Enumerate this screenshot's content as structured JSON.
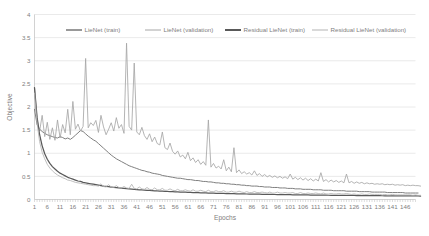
{
  "chart_data": {
    "type": "line",
    "title": "",
    "xlabel": "Epochs",
    "ylabel": "Objective",
    "xlim": [
      1,
      150
    ],
    "ylim": [
      0,
      4
    ],
    "grid": true,
    "legend_position": "top",
    "ytick_labels": [
      "0",
      "0.5",
      "1",
      "1.5",
      "2",
      "2.5",
      "3",
      "3.5",
      "4"
    ],
    "ytick_values": [
      0,
      0.5,
      1,
      1.5,
      2,
      2.5,
      3,
      3.5,
      4
    ],
    "xtick_labels": [
      "1",
      "6",
      "11",
      "16",
      "21",
      "26",
      "31",
      "36",
      "41",
      "46",
      "51",
      "56",
      "61",
      "66",
      "71",
      "76",
      "81",
      "86",
      "91",
      "96",
      "101",
      "106",
      "111",
      "116",
      "121",
      "126",
      "131",
      "136",
      "141",
      "146"
    ],
    "xtick_values": [
      1,
      6,
      11,
      16,
      21,
      26,
      31,
      36,
      41,
      46,
      51,
      56,
      61,
      66,
      71,
      76,
      81,
      86,
      91,
      96,
      101,
      106,
      111,
      116,
      121,
      126,
      131,
      136,
      141,
      146
    ],
    "colors": {
      "lienet_train": "#7f7f7f",
      "lienet_validation": "#a6a6a6",
      "residual_lienet_train": "#595959",
      "residual_lienet_validation": "#b3b3b3"
    },
    "series": [
      {
        "name": "LieNet (train)",
        "color": "#7f7f7f",
        "width": 1.0,
        "values": [
          1.95,
          1.62,
          1.52,
          1.47,
          1.43,
          1.4,
          1.38,
          1.36,
          1.34,
          1.33,
          1.36,
          1.34,
          1.31,
          1.33,
          1.3,
          1.34,
          1.39,
          1.44,
          1.49,
          1.47,
          1.42,
          1.37,
          1.33,
          1.29,
          1.26,
          1.21,
          1.16,
          1.11,
          1.06,
          1.01,
          0.96,
          0.92,
          0.88,
          0.85,
          0.82,
          0.79,
          0.76,
          0.73,
          0.71,
          0.69,
          0.67,
          0.65,
          0.63,
          0.62,
          0.6,
          0.59,
          0.57,
          0.56,
          0.55,
          0.54,
          0.52,
          0.51,
          0.5,
          0.49,
          0.48,
          0.47,
          0.46,
          0.46,
          0.45,
          0.44,
          0.43,
          0.43,
          0.42,
          0.41,
          0.41,
          0.4,
          0.39,
          0.39,
          0.38,
          0.38,
          0.37,
          0.36,
          0.36,
          0.35,
          0.35,
          0.34,
          0.34,
          0.33,
          0.33,
          0.32,
          0.32,
          0.31,
          0.31,
          0.3,
          0.3,
          0.29,
          0.29,
          0.29,
          0.28,
          0.28,
          0.27,
          0.27,
          0.27,
          0.26,
          0.26,
          0.26,
          0.25,
          0.25,
          0.25,
          0.24,
          0.24,
          0.24,
          0.23,
          0.23,
          0.23,
          0.22,
          0.22,
          0.22,
          0.22,
          0.21,
          0.21,
          0.21,
          0.21,
          0.2,
          0.2,
          0.2,
          0.2,
          0.19,
          0.19,
          0.19,
          0.19,
          0.19,
          0.18,
          0.18,
          0.18,
          0.18,
          0.18,
          0.17,
          0.17,
          0.17,
          0.17,
          0.17,
          0.16,
          0.16,
          0.16,
          0.16,
          0.16,
          0.16,
          0.15,
          0.15,
          0.15,
          0.15,
          0.15,
          0.15,
          0.15,
          0.14,
          0.14,
          0.14,
          0.14,
          0.14,
          0.14
        ]
      },
      {
        "name": "LieNet (validation)",
        "color": "#a6a6a6",
        "width": 0.85,
        "values": [
          2.42,
          1.73,
          1.48,
          1.82,
          1.36,
          1.67,
          1.3,
          1.55,
          1.28,
          1.72,
          1.33,
          1.62,
          1.44,
          1.95,
          1.4,
          2.12,
          1.52,
          1.63,
          1.48,
          1.58,
          3.05,
          1.55,
          1.66,
          1.6,
          1.71,
          1.45,
          1.82,
          1.57,
          1.4,
          1.52,
          1.66,
          1.48,
          1.77,
          1.54,
          1.62,
          1.43,
          3.38,
          1.58,
          1.5,
          2.95,
          1.46,
          1.4,
          1.56,
          1.38,
          1.3,
          1.42,
          1.25,
          1.35,
          1.21,
          1.18,
          1.46,
          1.12,
          1.08,
          1.22,
          1.04,
          0.98,
          1.05,
          0.92,
          0.96,
          0.88,
          1.02,
          0.84,
          0.9,
          0.8,
          0.86,
          0.76,
          0.82,
          0.74,
          1.72,
          0.7,
          0.78,
          0.68,
          0.72,
          0.66,
          0.86,
          0.62,
          0.7,
          0.6,
          1.12,
          0.58,
          0.64,
          0.56,
          0.6,
          0.55,
          0.58,
          0.53,
          0.62,
          0.52,
          0.56,
          0.5,
          0.54,
          0.49,
          0.52,
          0.48,
          0.51,
          0.47,
          0.5,
          0.46,
          0.49,
          0.45,
          0.55,
          0.44,
          0.48,
          0.43,
          0.47,
          0.42,
          0.46,
          0.41,
          0.45,
          0.4,
          0.44,
          0.4,
          0.58,
          0.39,
          0.43,
          0.38,
          0.42,
          0.38,
          0.41,
          0.37,
          0.4,
          0.36,
          0.55,
          0.36,
          0.39,
          0.35,
          0.38,
          0.35,
          0.37,
          0.34,
          0.36,
          0.34,
          0.35,
          0.33,
          0.34,
          0.33,
          0.34,
          0.32,
          0.33,
          0.32,
          0.33,
          0.31,
          0.32,
          0.31,
          0.32,
          0.3,
          0.31,
          0.3,
          0.31,
          0.3,
          0.3,
          0.29
        ]
      },
      {
        "name": "Residual LieNet (train)",
        "color": "#595959",
        "width": 1.25,
        "values": [
          2.42,
          1.78,
          1.4,
          1.16,
          0.99,
          0.87,
          0.78,
          0.71,
          0.66,
          0.61,
          0.57,
          0.54,
          0.51,
          0.48,
          0.46,
          0.44,
          0.42,
          0.4,
          0.39,
          0.37,
          0.36,
          0.35,
          0.34,
          0.33,
          0.32,
          0.31,
          0.3,
          0.29,
          0.285,
          0.277,
          0.27,
          0.263,
          0.256,
          0.25,
          0.244,
          0.238,
          0.233,
          0.228,
          0.223,
          0.218,
          0.214,
          0.21,
          0.206,
          0.202,
          0.198,
          0.195,
          0.191,
          0.188,
          0.185,
          0.182,
          0.179,
          0.176,
          0.173,
          0.171,
          0.168,
          0.166,
          0.163,
          0.161,
          0.159,
          0.157,
          0.155,
          0.153,
          0.151,
          0.149,
          0.147,
          0.145,
          0.143,
          0.142,
          0.14,
          0.138,
          0.137,
          0.135,
          0.134,
          0.132,
          0.131,
          0.129,
          0.128,
          0.127,
          0.125,
          0.124,
          0.123,
          0.122,
          0.12,
          0.119,
          0.118,
          0.117,
          0.116,
          0.115,
          0.114,
          0.113,
          0.112,
          0.111,
          0.11,
          0.109,
          0.108,
          0.107,
          0.106,
          0.105,
          0.105,
          0.104,
          0.103,
          0.102,
          0.101,
          0.101,
          0.1,
          0.099,
          0.098,
          0.098,
          0.097,
          0.096,
          0.096,
          0.095,
          0.094,
          0.094,
          0.093,
          0.092,
          0.092,
          0.091,
          0.091,
          0.09,
          0.089,
          0.089,
          0.088,
          0.088,
          0.087,
          0.087,
          0.086,
          0.086,
          0.085,
          0.085,
          0.084,
          0.084,
          0.083,
          0.083,
          0.082,
          0.082,
          0.081,
          0.081,
          0.08,
          0.08,
          0.08,
          0.079,
          0.079,
          0.078,
          0.078,
          0.078,
          0.077,
          0.077,
          0.076,
          0.076,
          0.076,
          0.075
        ]
      },
      {
        "name": "Residual LieNet (validation)",
        "color": "#b3b3b3",
        "width": 0.85,
        "values": [
          2.3,
          1.65,
          1.25,
          1.02,
          0.88,
          0.76,
          0.68,
          0.62,
          0.57,
          0.53,
          0.5,
          0.47,
          0.45,
          0.42,
          0.41,
          0.39,
          0.37,
          0.36,
          0.35,
          0.34,
          0.33,
          0.32,
          0.31,
          0.3,
          0.3,
          0.29,
          0.34,
          0.28,
          0.27,
          0.32,
          0.27,
          0.26,
          0.3,
          0.26,
          0.25,
          0.28,
          0.25,
          0.24,
          0.33,
          0.24,
          0.23,
          0.27,
          0.23,
          0.22,
          0.26,
          0.22,
          0.21,
          0.25,
          0.21,
          0.21,
          0.24,
          0.2,
          0.2,
          0.23,
          0.2,
          0.19,
          0.22,
          0.19,
          0.19,
          0.21,
          0.19,
          0.18,
          0.21,
          0.18,
          0.18,
          0.2,
          0.18,
          0.17,
          0.2,
          0.17,
          0.17,
          0.19,
          0.17,
          0.17,
          0.19,
          0.16,
          0.16,
          0.18,
          0.16,
          0.16,
          0.18,
          0.16,
          0.15,
          0.17,
          0.15,
          0.15,
          0.17,
          0.15,
          0.15,
          0.16,
          0.15,
          0.14,
          0.16,
          0.14,
          0.14,
          0.16,
          0.14,
          0.14,
          0.15,
          0.14,
          0.14,
          0.15,
          0.13,
          0.13,
          0.15,
          0.13,
          0.13,
          0.14,
          0.13,
          0.13,
          0.14,
          0.13,
          0.12,
          0.14,
          0.12,
          0.12,
          0.13,
          0.12,
          0.12,
          0.13,
          0.12,
          0.12,
          0.13,
          0.12,
          0.11,
          0.12,
          0.11,
          0.11,
          0.12,
          0.11,
          0.11,
          0.12,
          0.11,
          0.11,
          0.11,
          0.11,
          0.1,
          0.11,
          0.1,
          0.1,
          0.11,
          0.1,
          0.1,
          0.1,
          0.1,
          0.1,
          0.1,
          0.1,
          0.09,
          0.1,
          0.09,
          0.09
        ]
      }
    ]
  },
  "legend": {
    "items": [
      {
        "label": "LieNet (train)",
        "color": "#7f7f7f",
        "width": 1.6
      },
      {
        "label": "LieNet (validation)",
        "color": "#a6a6a6",
        "width": 1.0
      },
      {
        "label": "Residual LieNet (train)",
        "color": "#595959",
        "width": 2.0
      },
      {
        "label": "Residual LieNet (validation)",
        "color": "#b3b3b3",
        "width": 1.0
      }
    ]
  }
}
